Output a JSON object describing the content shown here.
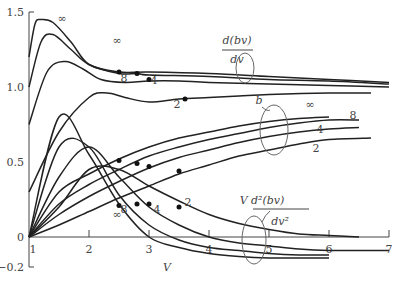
{
  "chart_data": {
    "type": "line",
    "title": "",
    "xlabel": "V",
    "ylabel": "",
    "xlim": [
      1,
      7
    ],
    "ylim": [
      -0.2,
      1.5
    ],
    "x_ticks": [
      "1",
      "2",
      "3",
      "4",
      "5",
      "6",
      "7"
    ],
    "y_ticks": [
      "-0.2",
      "0",
      "0.5",
      "1.0",
      "1.5"
    ],
    "grid": false,
    "parameter_labels": [
      "∞",
      "8",
      "4",
      "2"
    ],
    "families": [
      {
        "name": "d(bv)/dv",
        "label_num": "d(bv)",
        "label_den": "dv",
        "series": [
          {
            "name": "∞",
            "x": [
              1.0,
              1.1,
              1.2,
              1.4,
              1.7,
              2.0,
              2.5,
              3.0,
              4.0,
              5.0,
              6.0,
              7.0
            ],
            "y": [
              1.2,
              1.42,
              1.45,
              1.43,
              1.3,
              1.15,
              1.1,
              1.1,
              1.09,
              1.07,
              1.05,
              1.03
            ]
          },
          {
            "name": "8",
            "x": [
              1.0,
              1.2,
              1.4,
              1.7,
              2.0,
              2.5,
              2.8,
              3.0,
              4.0,
              5.0,
              6.0,
              7.0
            ],
            "y": [
              1.0,
              1.3,
              1.35,
              1.25,
              1.15,
              1.09,
              1.09,
              1.08,
              1.07,
              1.05,
              1.04,
              1.02
            ]
          },
          {
            "name": "4",
            "x": [
              1.0,
              1.3,
              1.6,
              1.9,
              2.2,
              2.6,
              3.0,
              3.5,
              4.0,
              5.0,
              6.0,
              7.0
            ],
            "y": [
              0.75,
              1.1,
              1.17,
              1.12,
              1.05,
              1.03,
              1.04,
              1.04,
              1.03,
              1.02,
              1.01,
              1.0
            ]
          },
          {
            "name": "2",
            "x": [
              1.0,
              1.5,
              2.0,
              2.3,
              2.6,
              3.0,
              3.5,
              4.0,
              4.5,
              5.0,
              6.0,
              6.7
            ],
            "y": [
              0.3,
              0.7,
              0.93,
              0.96,
              0.93,
              0.9,
              0.92,
              0.93,
              0.94,
              0.95,
              0.96,
              0.96
            ]
          }
        ],
        "marked_points": [
          {
            "series": "∞",
            "x": 2.5,
            "y": 1.1
          },
          {
            "series": "8",
            "x": 2.8,
            "y": 1.09
          },
          {
            "series": "4",
            "x": 3.0,
            "y": 1.05
          },
          {
            "series": "2",
            "x": 3.6,
            "y": 0.92
          }
        ]
      },
      {
        "name": "b",
        "label": "b",
        "series": [
          {
            "name": "∞",
            "x": [
              1.0,
              1.5,
              2.0,
              2.5,
              3.0,
              3.5,
              4.0,
              4.5,
              5.0,
              5.5,
              6.0
            ],
            "y": [
              0.0,
              0.3,
              0.42,
              0.52,
              0.6,
              0.66,
              0.7,
              0.74,
              0.77,
              0.79,
              0.8
            ]
          },
          {
            "name": "8",
            "x": [
              1.0,
              1.5,
              2.0,
              2.5,
              3.0,
              3.5,
              4.0,
              4.5,
              5.0,
              5.5,
              6.0,
              6.5
            ],
            "y": [
              0.0,
              0.22,
              0.35,
              0.45,
              0.54,
              0.6,
              0.65,
              0.69,
              0.73,
              0.76,
              0.78,
              0.78
            ]
          },
          {
            "name": "4",
            "x": [
              1.0,
              1.5,
              2.0,
              2.5,
              3.0,
              3.5,
              4.0,
              4.5,
              5.0,
              5.5,
              6.0,
              6.5
            ],
            "y": [
              0.0,
              0.15,
              0.27,
              0.37,
              0.46,
              0.53,
              0.58,
              0.63,
              0.67,
              0.7,
              0.72,
              0.73
            ]
          },
          {
            "name": "2",
            "x": [
              1.0,
              1.5,
              2.0,
              2.5,
              3.0,
              3.5,
              4.0,
              4.5,
              5.0,
              5.5,
              6.0,
              6.7
            ],
            "y": [
              0.0,
              0.08,
              0.17,
              0.26,
              0.34,
              0.42,
              0.48,
              0.54,
              0.58,
              0.62,
              0.65,
              0.66
            ]
          }
        ],
        "marked_points": [
          {
            "series": "∞",
            "x": 2.5,
            "y": 0.51
          },
          {
            "series": "8",
            "x": 2.8,
            "y": 0.49
          },
          {
            "series": "4",
            "x": 3.0,
            "y": 0.47
          },
          {
            "series": "2",
            "x": 3.5,
            "y": 0.44
          }
        ]
      },
      {
        "name": "V d²(bv)/dv²",
        "label_prefix": "V",
        "label_num": "d²(bv)",
        "label_den": "dv²",
        "series": [
          {
            "name": "∞",
            "x": [
              1.0,
              1.5,
              2.0,
              2.5,
              3.0,
              3.5,
              4.0,
              4.5,
              5.0,
              5.5,
              6.0
            ],
            "y": [
              0.0,
              0.8,
              0.55,
              0.22,
              0.0,
              -0.07,
              -0.11,
              -0.13,
              -0.14,
              -0.14,
              -0.14
            ]
          },
          {
            "name": "8",
            "x": [
              1.0,
              1.5,
              2.0,
              2.5,
              3.0,
              3.5,
              4.0,
              4.5,
              5.0,
              5.5,
              6.0
            ],
            "y": [
              0.0,
              0.6,
              0.6,
              0.28,
              0.08,
              -0.02,
              -0.07,
              -0.09,
              -0.11,
              -0.12,
              -0.12
            ]
          },
          {
            "name": "4",
            "x": [
              1.0,
              1.5,
              2.0,
              2.5,
              3.0,
              3.5,
              4.0,
              4.5,
              5.0,
              5.5,
              6.0,
              6.5,
              7.0
            ],
            "y": [
              0.0,
              0.4,
              0.6,
              0.4,
              0.2,
              0.08,
              0.0,
              -0.04,
              -0.06,
              -0.08,
              -0.09,
              -0.09,
              -0.09
            ]
          },
          {
            "name": "2",
            "x": [
              1.0,
              1.5,
              2.0,
              2.5,
              3.0,
              3.5,
              4.0,
              4.5,
              5.0,
              5.5,
              6.0,
              6.5
            ],
            "y": [
              0.0,
              0.2,
              0.45,
              0.45,
              0.34,
              0.24,
              0.15,
              0.09,
              0.05,
              0.02,
              0.01,
              0.0
            ]
          }
        ],
        "marked_points": [
          {
            "series": "∞",
            "x": 2.5,
            "y": 0.21
          },
          {
            "series": "8",
            "x": 2.8,
            "y": 0.22
          },
          {
            "series": "4",
            "x": 3.0,
            "y": 0.22
          },
          {
            "series": "2",
            "x": 3.5,
            "y": 0.2
          }
        ]
      }
    ],
    "annotations": [
      "d(bv)/dv",
      "b",
      "V d²(bv)/dv²",
      "∞",
      "8",
      "4",
      "2"
    ]
  }
}
